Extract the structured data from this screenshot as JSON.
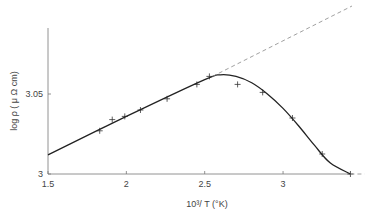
{
  "chart_data": {
    "type": "line",
    "title": "",
    "xlabel": "10³/ T (°K)",
    "ylabel": "log ρ  ( μ Ω cm)",
    "xlim": [
      1.5,
      3.5
    ],
    "ylim": [
      3.0,
      3.09
    ],
    "xticks": [
      1.5,
      2,
      2.5,
      3
    ],
    "xtick_labels": [
      "1.5",
      "2",
      "2.5",
      "3"
    ],
    "yticks": [
      3.0,
      3.05
    ],
    "ytick_labels": [
      "3",
      "3.05"
    ],
    "grid": false,
    "series": [
      {
        "name": "measured",
        "style": "markers-plus",
        "x": [
          1.83,
          1.91,
          1.99,
          2.09,
          2.26,
          2.45,
          2.53,
          2.71,
          2.87,
          3.06,
          3.25,
          3.43
        ],
        "y": [
          3.027,
          3.034,
          3.036,
          3.04,
          3.047,
          3.056,
          3.061,
          3.056,
          3.051,
          3.035,
          3.0125,
          3.0
        ]
      },
      {
        "name": "fit curve",
        "style": "solid",
        "x": [
          1.5,
          2.0,
          2.5,
          2.6,
          2.7,
          2.8,
          2.9,
          3.0,
          3.1,
          3.2,
          3.3,
          3.43
        ],
        "y": [
          3.012,
          3.036,
          3.059,
          3.062,
          3.061,
          3.057,
          3.05,
          3.041,
          3.03,
          3.018,
          3.007,
          3.0
        ]
      },
      {
        "name": "linear extrapolation",
        "style": "dashed",
        "x": [
          2.55,
          3.44
        ],
        "y": [
          3.061,
          3.105
        ]
      },
      {
        "name": "axis extension",
        "style": "dashed",
        "x": [
          3.43,
          3.52
        ],
        "y": [
          3.0,
          3.0
        ]
      }
    ]
  }
}
